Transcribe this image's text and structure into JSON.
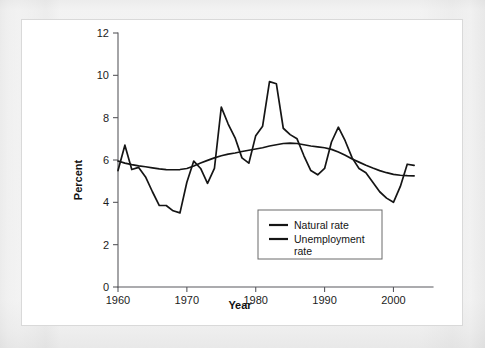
{
  "chart_data": {
    "type": "line",
    "title": "",
    "xlabel": "Year",
    "ylabel": "Percent",
    "xlim": [
      1960,
      2004
    ],
    "ylim": [
      0,
      12
    ],
    "xticks": [
      1960,
      1970,
      1980,
      1990,
      2000
    ],
    "yticks": [
      0,
      2,
      4,
      6,
      8,
      10,
      12
    ],
    "xtick_labels": [
      "1960",
      "1970",
      "1980",
      "1990",
      "2000"
    ],
    "ytick_labels": [
      "0",
      "2",
      "4",
      "6",
      "8",
      "10",
      "12"
    ],
    "grid": false,
    "legend_position": "lower center-right",
    "x": [
      1960,
      1961,
      1962,
      1963,
      1964,
      1965,
      1966,
      1967,
      1968,
      1969,
      1970,
      1971,
      1972,
      1973,
      1974,
      1975,
      1976,
      1977,
      1978,
      1979,
      1980,
      1981,
      1982,
      1983,
      1984,
      1985,
      1986,
      1987,
      1988,
      1989,
      1990,
      1991,
      1992,
      1993,
      1994,
      1995,
      1996,
      1997,
      1998,
      1999,
      2000,
      2001,
      2002,
      2003
    ],
    "series": [
      {
        "name": "Natural rate",
        "color": "#151515",
        "values": [
          5.95,
          5.85,
          5.78,
          5.72,
          5.68,
          5.63,
          5.58,
          5.55,
          5.54,
          5.55,
          5.6,
          5.72,
          5.86,
          5.98,
          6.1,
          6.2,
          6.28,
          6.33,
          6.4,
          6.46,
          6.52,
          6.58,
          6.66,
          6.72,
          6.78,
          6.8,
          6.78,
          6.72,
          6.66,
          6.62,
          6.58,
          6.5,
          6.38,
          6.22,
          6.05,
          5.9,
          5.75,
          5.62,
          5.5,
          5.4,
          5.32,
          5.28,
          5.26,
          5.25
        ]
      },
      {
        "name": "Unemployment rate",
        "color": "#151515",
        "values": [
          5.5,
          6.7,
          5.55,
          5.65,
          5.2,
          4.5,
          3.85,
          3.85,
          3.6,
          3.5,
          4.95,
          5.95,
          5.6,
          4.9,
          5.6,
          8.5,
          7.7,
          7.05,
          6.1,
          5.85,
          7.15,
          7.6,
          9.7,
          9.6,
          7.5,
          7.2,
          7.0,
          6.2,
          5.5,
          5.3,
          5.6,
          6.85,
          7.55,
          6.9,
          6.1,
          5.6,
          5.4,
          4.95,
          4.5,
          4.2,
          4.0,
          4.75,
          5.8,
          5.75
        ]
      }
    ]
  },
  "legend": {
    "entries": [
      {
        "label": "Natural rate"
      },
      {
        "label": "Unemployment",
        "label2": "rate"
      }
    ]
  }
}
